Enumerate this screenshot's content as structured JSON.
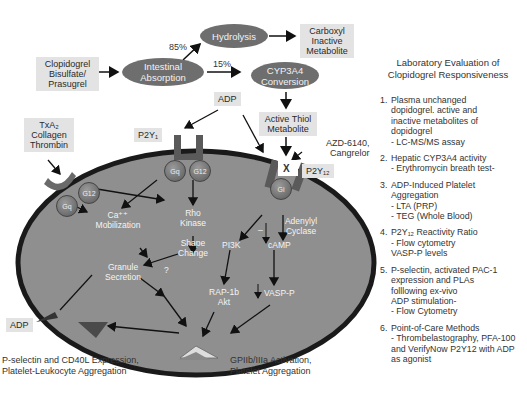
{
  "top_flow": {
    "drug_box": [
      "Clopidogrel",
      "Bisulfate/",
      "Prasugrel"
    ],
    "intestinal_absorption": [
      "Intestinal",
      "Absorption"
    ],
    "hydrolysis": "Hydrolysis",
    "carboxyl_box": [
      "Carboxyl",
      "Inactive",
      "Metabolite"
    ],
    "cyp3a4": [
      "CYP3A4",
      "Conversion"
    ],
    "pct_85": "85%",
    "pct_15": "15%",
    "adp_top": "ADP",
    "active_thiol": [
      "Active Thiol",
      "Metabolite"
    ],
    "antagonists": [
      "AZD-6140,",
      "Cangrelor"
    ],
    "block_mark": "X"
  },
  "receptors": {
    "txa2_box": [
      "TxA₂",
      "Collagen",
      "Thrombin"
    ],
    "p2y1": "P2Y₁",
    "p2y12": "P2Y₁₂",
    "gq": "Gq",
    "g12_right": "G12",
    "gq_left": "Gq",
    "g12_left": "G12",
    "gi": "Gi"
  },
  "platelet_interior": {
    "ca_mobilization": [
      "Ca⁺⁺",
      "Mobilization"
    ],
    "rho_kinase": [
      "Rho",
      "Kinase"
    ],
    "shape_change": [
      "Shape",
      "Change"
    ],
    "granule_secretion": [
      "Granule",
      "Secretion"
    ],
    "question": "?",
    "adenylyl_cyclase": [
      "Adenylyl",
      "Cyclase"
    ],
    "minus": "–",
    "pi3k": "PI3K",
    "camp": "cAMP",
    "rap1b": [
      "RAP-1b",
      "Akt"
    ],
    "vasp_p": "VASP-P"
  },
  "outputs": {
    "adp_bottom": "ADP",
    "pselectin": [
      "P-selectin and CD40L Expression,",
      "Platelet-Leukocyte Aggregation"
    ],
    "gpiib": [
      "GPIIb/IIIa Activation,",
      "Platelet Aggregation"
    ]
  },
  "lab_panel": {
    "title": [
      "Laboratory Evaluation of",
      "Clopidogrel Responsiveness"
    ],
    "items": [
      {
        "num": "1.",
        "lines": [
          "Plasma unchanged",
          "dopidogrel. active and",
          "inactive metabolites of",
          "dopidogrel",
          "- LC-MS/MS assay"
        ]
      },
      {
        "num": "2.",
        "lines": [
          "Hepatic CYP3A4 activity",
          "- Erythromycin breath test-"
        ]
      },
      {
        "num": "3.",
        "lines": [
          "ADP-Induced Platelet",
          "Aggregation",
          "- LTA (PRP)",
          "- TEG (Whole Blood)"
        ]
      },
      {
        "num": "4.",
        "lines": [
          "P2Y₁₂ Reactivity Ratio",
          "- Flow cytometry",
          "VASP-P levels"
        ]
      },
      {
        "num": "5.",
        "lines": [
          "P-selectin, activated PAC-1",
          "expression and PLAs",
          "folllowing ex-vivo",
          "ADP stimulation-",
          "- Flow Cytometry"
        ]
      },
      {
        "num": "6.",
        "lines": [
          "Point-of-Care Methods",
          "- Thrombelastography, PFA-100",
          "and VerifyNow P2Y12 with ADP",
          "as agonist"
        ]
      }
    ]
  },
  "colors": {
    "cell_fill": "#8f8f8f",
    "membrane": "#1a1a1a",
    "oval_fill": "#6e6e6e",
    "label_box": "#e3e3e3"
  }
}
